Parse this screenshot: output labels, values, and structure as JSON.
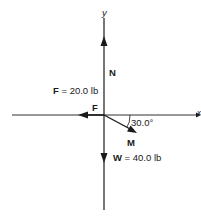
{
  "diagram": {
    "type": "free-body diagram",
    "axes": {
      "y_label": "y",
      "x_label": "x"
    },
    "forces": [
      {
        "name": "N",
        "label": "N",
        "direction": "up"
      },
      {
        "name": "F",
        "label": "F",
        "direction": "left",
        "value_label": "F = 20.0 lb",
        "symbol": "F",
        "value_text": " = 20.0 lb"
      },
      {
        "name": "M",
        "label": "M",
        "direction": "down-right",
        "angle_label": "30.0°"
      },
      {
        "name": "W",
        "label": "W",
        "direction": "down",
        "value_label": "W = 40.0 lb",
        "symbol": "W",
        "value_text": " = 40.0 lb"
      }
    ],
    "colors": {
      "line": "#1a1a1a",
      "background": "#ffffff"
    }
  }
}
